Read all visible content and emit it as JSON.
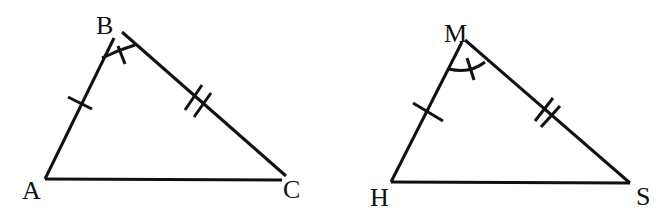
{
  "diagram": {
    "stroke_color": "#111111",
    "background": "#ffffff",
    "triangles": [
      {
        "name": "ABC",
        "vertices": {
          "A": {
            "label": "A",
            "x": 45,
            "y": 178
          },
          "B": {
            "label": "B",
            "x": 117,
            "y": 35
          },
          "C": {
            "label": "C",
            "x": 287,
            "y": 177
          }
        },
        "markings": {
          "AB": "single tick",
          "BC": "double tick",
          "angle_B": "arc with single tick"
        }
      },
      {
        "name": "HMS",
        "vertices": {
          "H": {
            "label": "H",
            "x": 391,
            "y": 182
          },
          "M": {
            "label": "M",
            "x": 464,
            "y": 40
          },
          "S": {
            "label": "S",
            "x": 629,
            "y": 183
          }
        },
        "markings": {
          "HM": "single tick",
          "MS": "double tick",
          "angle_M": "arc with single tick"
        }
      }
    ]
  }
}
